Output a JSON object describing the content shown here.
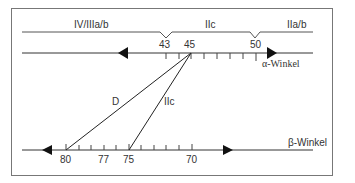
{
  "regions": {
    "left": "IV/IIIa/b",
    "middle": "IIc",
    "right": "IIa/b"
  },
  "alpha_axis": {
    "label": "α-Winkel",
    "tick_labels": [
      "43",
      "45",
      "50"
    ]
  },
  "beta_axis": {
    "label": "β-Winkel",
    "tick_labels": [
      "80",
      "77",
      "75",
      "70"
    ]
  },
  "lines": {
    "d_label": "D",
    "iic_label": "IIc"
  }
}
